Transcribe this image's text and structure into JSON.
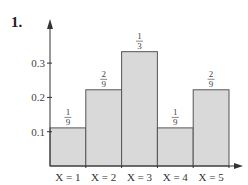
{
  "problem_number": "1.",
  "chart_data": {
    "type": "bar",
    "title": "",
    "xlabel": "",
    "ylabel": "",
    "categories": [
      "X = 1",
      "X = 2",
      "X = 3",
      "X = 4",
      "X = 5"
    ],
    "values": [
      0.1111,
      0.2222,
      0.3333,
      0.1111,
      0.2222
    ],
    "value_labels": [
      {
        "num": "1",
        "den": "9"
      },
      {
        "num": "2",
        "den": "9"
      },
      {
        "num": "1",
        "den": "3"
      },
      {
        "num": "1",
        "den": "9"
      },
      {
        "num": "2",
        "den": "9"
      }
    ],
    "yticks": [
      0.1,
      0.2,
      0.3
    ],
    "ytick_labels": [
      "0.1",
      "0.2",
      "0.3"
    ],
    "ylim": [
      0,
      0.4
    ],
    "grid": false,
    "legend": null,
    "bar_fill": "#d9d9d9",
    "bar_stroke": "#555555",
    "axis_color": "#333333"
  }
}
